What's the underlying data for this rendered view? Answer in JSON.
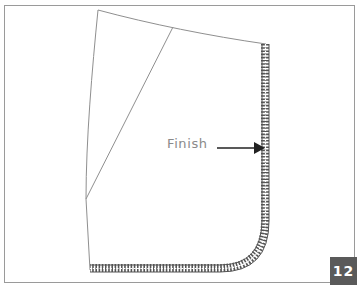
{
  "figure": {
    "callout": {
      "label": "Finish",
      "arrow_icon": "arrow-right-icon"
    },
    "step_badge": {
      "number": "12"
    },
    "colors": {
      "outline": "#8f8f8f",
      "serge": "#555555",
      "arrow": "#222222",
      "label_text": "#8a8a8a",
      "badge_bg": "#5a5a5a",
      "badge_text": "#ffffff",
      "frame": "#9a9a9a"
    },
    "shapes": {
      "garment_piece": "pattern-piece-outline",
      "dart_line": "dart-line",
      "serged_edge": "overlocked-finished-edge"
    }
  }
}
